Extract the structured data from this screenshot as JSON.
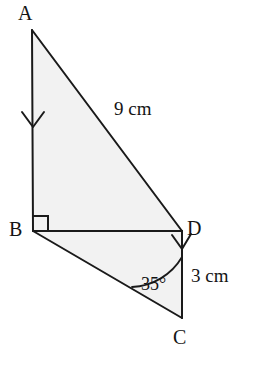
{
  "figure": {
    "kind": "geometry-diagram",
    "background_color": "#ffffff",
    "fill_color": "#f2f2f2",
    "stroke_color": "#1a1a1a"
  },
  "vertices": {
    "A": {
      "label": "A",
      "x": 32,
      "y": 30
    },
    "B": {
      "label": "B",
      "x": 33,
      "y": 231
    },
    "C": {
      "label": "C",
      "x": 182,
      "y": 318
    },
    "D": {
      "label": "D",
      "x": 182,
      "y": 231
    }
  },
  "measurements": {
    "side_ad": "9 cm",
    "side_dc": "3 cm",
    "angle_c": "35°"
  },
  "markers": {
    "right_angle_at_b": "right-angle-square",
    "arrow_on_ab": "down-arrow",
    "arrow_at_d": "down-arrow"
  }
}
